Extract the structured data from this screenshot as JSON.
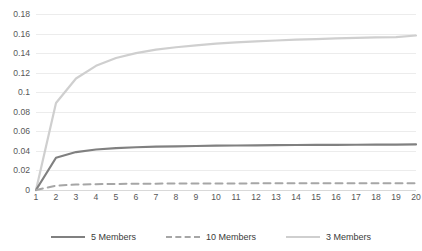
{
  "chart_data": {
    "type": "line",
    "title": "",
    "xlabel": "",
    "ylabel": "",
    "x": [
      1,
      2,
      3,
      4,
      5,
      6,
      7,
      8,
      9,
      10,
      11,
      12,
      13,
      14,
      15,
      16,
      17,
      18,
      19,
      20
    ],
    "xtick_labels": [
      "1",
      "2",
      "3",
      "4",
      "5",
      "6",
      "7",
      "8",
      "9",
      "10",
      "11",
      "12",
      "13",
      "14",
      "15",
      "16",
      "17",
      "18",
      "19",
      "20"
    ],
    "ytick_labels": [
      "0",
      "0.02",
      "0.04",
      "0.06",
      "0.08",
      "0.1",
      "0.12",
      "0.14",
      "0.16",
      "0.18"
    ],
    "ytick_values": [
      0,
      0.02,
      0.04,
      0.06,
      0.08,
      0.1,
      0.12,
      0.14,
      0.16,
      0.18
    ],
    "ylim": [
      0,
      0.18
    ],
    "xlim": [
      1,
      20
    ],
    "grid": true,
    "legend_position": "bottom",
    "series": [
      {
        "name": "5 Members",
        "color": "#808080",
        "style": "solid",
        "width": 2.2,
        "values": [
          0,
          0.033,
          0.0388,
          0.0414,
          0.0428,
          0.0437,
          0.0443,
          0.0447,
          0.045,
          0.0453,
          0.0455,
          0.0457,
          0.0458,
          0.046,
          0.0461,
          0.0462,
          0.0463,
          0.0464,
          0.0465,
          0.0466
        ]
      },
      {
        "name": "10 Members",
        "color": "#a6a6a6",
        "style": "dashed",
        "width": 2.0,
        "values": [
          0,
          0.0045,
          0.0055,
          0.006,
          0.0062,
          0.0064,
          0.0065,
          0.0066,
          0.0066,
          0.0067,
          0.0067,
          0.0068,
          0.0068,
          0.0068,
          0.0069,
          0.0069,
          0.0069,
          0.0069,
          0.007,
          0.007
        ]
      },
      {
        "name": "3 Members",
        "color": "#cfcfcf",
        "style": "solid",
        "width": 2.2,
        "values": [
          0,
          0.089,
          0.114,
          0.127,
          0.135,
          0.14,
          0.1435,
          0.146,
          0.148,
          0.1496,
          0.1509,
          0.152,
          0.1529,
          0.1537,
          0.1544,
          0.155,
          0.1555,
          0.156,
          0.1564,
          0.158
        ]
      }
    ],
    "legend": [
      {
        "label": "5 Members",
        "color": "#808080",
        "style": "solid"
      },
      {
        "label": "10 Members",
        "color": "#a6a6a6",
        "style": "dashed"
      },
      {
        "label": "3 Members",
        "color": "#cfcfcf",
        "style": "solid"
      }
    ],
    "colors": {
      "gridline": "#ececec",
      "axis": "#d9d9d9",
      "tick_text": "#575757",
      "legend_text": "#3b3b3b",
      "background": "#ffffff"
    }
  }
}
